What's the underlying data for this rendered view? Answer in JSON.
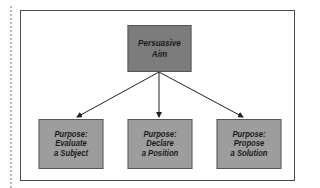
{
  "diagram": {
    "root": {
      "line1": "Persuasive",
      "line2": "Aim",
      "fill": "#7c7c7c"
    },
    "children": [
      {
        "line1": "Purpose:",
        "line2": "Evaluate",
        "line3": "a Subject",
        "fill": "#9d9d9d"
      },
      {
        "line1": "Purpose:",
        "line2": "Declare",
        "line3": "a Position",
        "fill": "#9d9d9d"
      },
      {
        "line1": "Purpose:",
        "line2": "Propose",
        "line3": "a Solution",
        "fill": "#9d9d9d"
      }
    ],
    "edges": [
      {
        "from": "Persuasive Aim",
        "to": "Evaluate a Subject"
      },
      {
        "from": "Persuasive Aim",
        "to": "Declare a Position"
      },
      {
        "from": "Persuasive Aim",
        "to": "Propose a Solution"
      }
    ]
  }
}
